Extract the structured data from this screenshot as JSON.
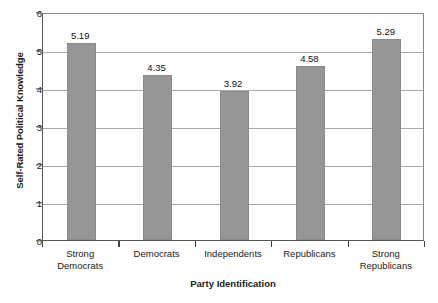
{
  "chart_data": {
    "type": "bar",
    "title": "",
    "xlabel": "Party Identification",
    "ylabel": "Self-Rated Political Knowledge",
    "categories": [
      "Strong Democrats",
      "Democrats",
      "Independents",
      "Republicans",
      "Strong Republicans"
    ],
    "category_lines": [
      [
        "Strong",
        "Democrats"
      ],
      [
        "Democrats"
      ],
      [
        "Independents"
      ],
      [
        "Republicans"
      ],
      [
        "Strong",
        "Republicans"
      ]
    ],
    "values": [
      5.19,
      4.35,
      3.92,
      4.58,
      5.29
    ],
    "value_labels": [
      "5.19",
      "4.35",
      "3.92",
      "4.58",
      "5.29"
    ],
    "ylim": [
      0,
      6
    ],
    "ytick_labels": [
      "0",
      "1",
      "2",
      "3",
      "4",
      "5",
      "6"
    ],
    "ytick_values": [
      0,
      1,
      2,
      3,
      4,
      5,
      6
    ],
    "grid": true,
    "legend": "none",
    "bar_color": "#969696",
    "gridline_color": "#aaaaaa",
    "axis_color": "#555555",
    "text_color": "#1a1a1a"
  },
  "footer": {
    "caption_fragment": ""
  }
}
